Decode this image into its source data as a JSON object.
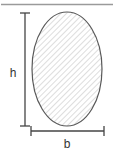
{
  "figure": {
    "type": "geometry-diagram",
    "shape_name": "ellipse",
    "description_text": "",
    "top_rule": {
      "name": "top-horizontal-rule",
      "color": "#999999"
    },
    "shape": {
      "name": "ellipse-shape",
      "fill_pattern": "diagonal-hatch",
      "fill_color": "#ffffff",
      "hatch_color": "#bbbbbb",
      "stroke_color": "#555555",
      "center_x": 67,
      "center_y": 69,
      "radius_x": 35,
      "radius_y": 57
    },
    "dimensions": [
      {
        "id": "height-dimension",
        "label": "h",
        "orientation": "vertical",
        "label_x": 13,
        "label_y": 74,
        "line_x": 25,
        "line_y1": 13,
        "line_y2": 126,
        "tick_half_width": 5,
        "color": "#444444"
      },
      {
        "id": "width-dimension",
        "label": "b",
        "orientation": "horizontal",
        "label_x": 67,
        "label_y": 145,
        "line_y": 131,
        "line_x1": 31,
        "line_x2": 104,
        "tick_half_height": 5,
        "color": "#444444"
      }
    ]
  }
}
